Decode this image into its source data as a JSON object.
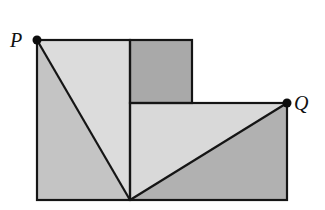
{
  "diagram": {
    "points": {
      "P": {
        "label": "P",
        "x": 37,
        "y": 40
      },
      "Q": {
        "label": "Q",
        "x": 287,
        "y": 103
      },
      "B": {
        "x": 130,
        "y": 200
      }
    },
    "shapes": {
      "left_square": {
        "x": 37,
        "y": 40,
        "w": 93,
        "h": 160
      },
      "small_square": {
        "x": 130,
        "y": 40,
        "w": 62,
        "h": 62
      },
      "right_rect": {
        "x": 130,
        "y": 103,
        "w": 157,
        "h": 97
      }
    },
    "colors": {
      "left_triangle": "#c4c4c4",
      "left_upper_region": "#dcdcdc",
      "small_square": "#a9a9a9",
      "right_upper_triangle": "#d9d9d9",
      "right_lower_triangle": "#b1b1b1",
      "stroke": "#151515",
      "dot": "#0d0d0d"
    },
    "labels": {
      "P": "P",
      "Q": "Q"
    }
  }
}
